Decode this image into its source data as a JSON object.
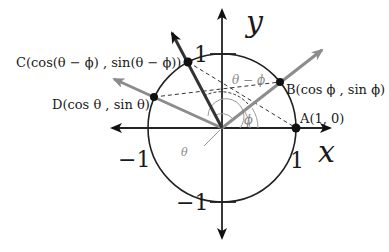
{
  "diagram": {
    "type": "unit-circle",
    "colors": {
      "axis": "#222222",
      "circle": "#222222",
      "ray_dark": "#333333",
      "ray_gray": "#8c8c8c",
      "dashed": "#333333",
      "angle_arc": "#9a9a9a",
      "point": "#111111"
    },
    "axes": {
      "x_label": "x",
      "y_label": "y",
      "tick_pos_x": "1",
      "tick_neg_x": "−1",
      "tick_pos_y": "1",
      "tick_neg_y": "−1"
    },
    "points": {
      "A": {
        "label": "A(1, 0)"
      },
      "B": {
        "label": "B(cos ϕ , sin ϕ)"
      },
      "C": {
        "label": "C(cos(θ − ϕ) , sin(θ − ϕ))"
      },
      "D": {
        "label": "D(cos θ , sin θ)"
      }
    },
    "angles": {
      "theta": "θ",
      "phi": "ϕ",
      "theta_minus_phi": "θ − ϕ"
    }
  }
}
